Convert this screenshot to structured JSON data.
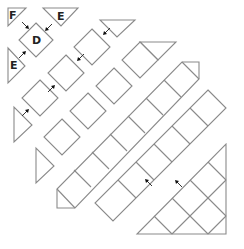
{
  "diagram": {
    "labels": {
      "F": "F",
      "D": "D",
      "E_top": "E",
      "E_left": "E"
    },
    "colors": {
      "stroke": "#8a8a8a",
      "arrow": "#111111",
      "text": "#222222",
      "background": "#ffffff"
    },
    "bands": [
      {
        "name": "band-1",
        "cells": 1,
        "caps": [
          "F",
          "E",
          "E"
        ]
      },
      {
        "name": "band-2",
        "cells": 3,
        "caps": [
          "triangle-top",
          "triangle-left"
        ]
      },
      {
        "name": "band-3",
        "cells": 4,
        "caps": [
          "triangle-top-right",
          "triangle-bottom-left"
        ]
      },
      {
        "name": "band-4",
        "cells": 5,
        "caps": [
          "triangle-top-right",
          "triangle-bottom-left"
        ]
      },
      {
        "name": "band-5",
        "cells": 6,
        "caps": [
          "triangle-right"
        ]
      }
    ],
    "arrow_count": 9
  }
}
